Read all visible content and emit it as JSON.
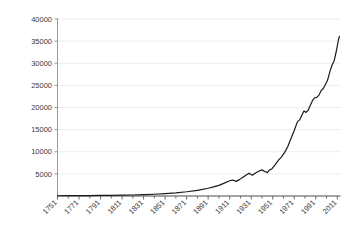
{
  "chart_data": {
    "type": "line",
    "title": "",
    "subtitle": "",
    "xlabel": "",
    "ylabel": "",
    "xlim": [
      1751,
      2014
    ],
    "ylim": [
      0,
      40000
    ],
    "grid": true,
    "grid_axis": "y",
    "legend": "none",
    "line_color": "#1a1a1a",
    "grid_color": "#ededed",
    "axis_color": "#808080",
    "tick_label_color": "#3a3a3a",
    "y_ticks": [
      0,
      5000,
      10000,
      15000,
      20000,
      25000,
      30000,
      35000,
      40000
    ],
    "y_tick_labels": [
      "",
      "5000",
      "10000",
      "15000",
      "20000",
      "25000",
      "30000",
      "35000",
      "40000"
    ],
    "x_ticks": [
      1751,
      1771,
      1791,
      1811,
      1831,
      1851,
      1871,
      1891,
      1911,
      1931,
      1951,
      1971,
      1991,
      2011
    ],
    "x_tick_labels": [
      "1751",
      "1771",
      "1791",
      "1811",
      "1831",
      "1851",
      "1871",
      "1891",
      "1911",
      "1931",
      "1951",
      "1971",
      "1991",
      "2011"
    ],
    "x_minor_tick_step": 10,
    "x_tick_label_rotation": -45,
    "series": [
      {
        "name": "series-1",
        "x": [
          1751,
          1761,
          1771,
          1781,
          1791,
          1801,
          1811,
          1821,
          1831,
          1841,
          1851,
          1861,
          1871,
          1881,
          1891,
          1896,
          1901,
          1906,
          1911,
          1914,
          1917,
          1920,
          1923,
          1926,
          1929,
          1932,
          1935,
          1938,
          1941,
          1944,
          1946,
          1948,
          1950,
          1953,
          1956,
          1959,
          1962,
          1965,
          1968,
          1971,
          1974,
          1976,
          1978,
          1980,
          1982,
          1984,
          1986,
          1988,
          1990,
          1992,
          1994,
          1996,
          1998,
          2000,
          2002,
          2004,
          2006,
          2008,
          2010,
          2012,
          2013
        ],
        "y": [
          60,
          70,
          85,
          100,
          120,
          145,
          180,
          230,
          300,
          400,
          540,
          720,
          960,
          1280,
          1750,
          2050,
          2400,
          2900,
          3450,
          3600,
          3300,
          3700,
          4200,
          4700,
          5150,
          4700,
          5200,
          5600,
          5900,
          5500,
          5300,
          5900,
          6100,
          7000,
          8000,
          8800,
          9800,
          11200,
          13000,
          14800,
          16800,
          17200,
          18200,
          19200,
          18900,
          19400,
          20500,
          21600,
          22200,
          22300,
          22800,
          23800,
          24300,
          25200,
          26200,
          28000,
          29500,
          30500,
          32600,
          35200,
          36100
        ]
      }
    ]
  }
}
